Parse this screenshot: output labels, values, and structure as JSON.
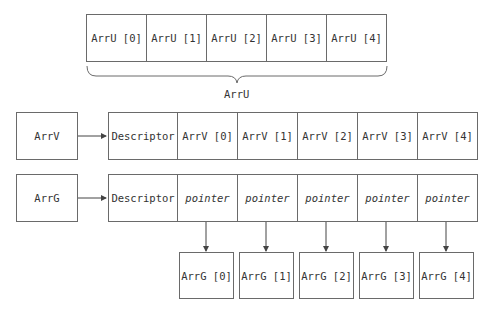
{
  "arr_u": {
    "cells": [
      "ArrU [0]",
      "ArrU [1]",
      "ArrU [2]",
      "ArrU [3]",
      "ArrU [4]"
    ],
    "brace_label": "ArrU"
  },
  "arr_v": {
    "name": "ArrV",
    "descriptor": "Descriptor",
    "cells": [
      "ArrV [0]",
      "ArrV [1]",
      "ArrV [2]",
      "ArrV [3]",
      "ArrV [4]"
    ]
  },
  "arr_g": {
    "name": "ArrG",
    "descriptor": "Descriptor",
    "cells": [
      "pointer",
      "pointer",
      "pointer",
      "pointer",
      "pointer"
    ],
    "targets": [
      "ArrG [0]",
      "ArrG [1]",
      "ArrG [2]",
      "ArrG [3]",
      "ArrG [4]"
    ]
  },
  "colors": {
    "line": "#6a6a6a",
    "text": "#333333"
  }
}
